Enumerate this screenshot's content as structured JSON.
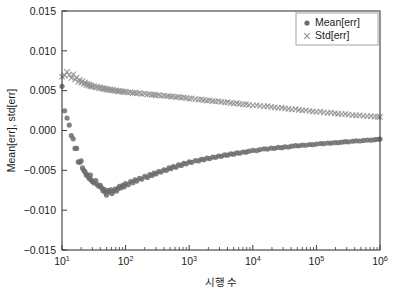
{
  "chart_data": {
    "type": "scatter",
    "title": "",
    "xlabel": "시행 수",
    "ylabel": "Mean[err], std[err]",
    "xscale": "log",
    "yscale": "linear",
    "xlim": [
      10,
      1000000
    ],
    "ylim": [
      -0.015,
      0.015
    ],
    "grid": false,
    "legend_position": "top-right",
    "xticks": [
      {
        "value": 10,
        "label": "10",
        "exponent": "1"
      },
      {
        "value": 100,
        "label": "10",
        "exponent": "2"
      },
      {
        "value": 1000,
        "label": "10",
        "exponent": "3"
      },
      {
        "value": 10000,
        "label": "10",
        "exponent": "4"
      },
      {
        "value": 100000,
        "label": "10",
        "exponent": "5"
      },
      {
        "value": 1000000,
        "label": "10",
        "exponent": "6"
      }
    ],
    "yticks": [
      {
        "value": 0.015,
        "label": "0.015"
      },
      {
        "value": 0.01,
        "label": "0.010"
      },
      {
        "value": 0.005,
        "label": "0.005"
      },
      {
        "value": 0.0,
        "label": "0.000"
      },
      {
        "value": -0.005,
        "label": "−0.005"
      },
      {
        "value": -0.01,
        "label": "−0.010"
      },
      {
        "value": -0.015,
        "label": "−0.015"
      }
    ],
    "series": [
      {
        "name": "Mean[err]",
        "marker": "circle",
        "color": "#6b6b6b",
        "points": [
          [
            10,
            0.00555
          ],
          [
            11,
            0.00248
          ],
          [
            12,
            0.00157
          ],
          [
            13,
            0.00068
          ],
          [
            14,
            -0.00065
          ],
          [
            15,
            -0.00105
          ],
          [
            16,
            -0.00225
          ],
          [
            17,
            -0.00225
          ],
          [
            18,
            -0.00395
          ],
          [
            19,
            -0.004
          ],
          [
            20,
            -0.00382
          ],
          [
            21,
            -0.0047
          ],
          [
            22,
            -0.005
          ],
          [
            23,
            -0.0052
          ],
          [
            24,
            -0.0056
          ],
          [
            25,
            -0.00555
          ],
          [
            26,
            -0.00585
          ],
          [
            27,
            -0.00605
          ],
          [
            28,
            -0.0056
          ],
          [
            29,
            -0.0062
          ],
          [
            30,
            -0.0064
          ],
          [
            32,
            -0.0066
          ],
          [
            34,
            -0.0063
          ],
          [
            36,
            -0.0068
          ],
          [
            38,
            -0.007
          ],
          [
            40,
            -0.0069
          ],
          [
            42,
            -0.0072
          ],
          [
            44,
            -0.00755
          ],
          [
            46,
            -0.0074
          ],
          [
            48,
            -0.00775
          ],
          [
            50,
            -0.0081
          ],
          [
            52,
            -0.00755
          ],
          [
            55,
            -0.0077
          ],
          [
            58,
            -0.00745
          ],
          [
            61,
            -0.0079
          ],
          [
            64,
            -0.0076
          ],
          [
            68,
            -0.00735
          ],
          [
            72,
            -0.0076
          ],
          [
            76,
            -0.0073
          ],
          [
            80,
            -0.007
          ],
          [
            85,
            -0.0072
          ],
          [
            90,
            -0.0069
          ],
          [
            95,
            -0.00705
          ],
          [
            100,
            -0.00665
          ],
          [
            110,
            -0.0068
          ],
          [
            120,
            -0.0064
          ],
          [
            130,
            -0.00655
          ],
          [
            140,
            -0.0062
          ],
          [
            150,
            -0.00635
          ],
          [
            165,
            -0.006
          ],
          [
            180,
            -0.0061
          ],
          [
            200,
            -0.00575
          ],
          [
            220,
            -0.0059
          ],
          [
            240,
            -0.00555
          ],
          [
            260,
            -0.00565
          ],
          [
            280,
            -0.00535
          ],
          [
            300,
            -0.00545
          ],
          [
            330,
            -0.00515
          ],
          [
            360,
            -0.0052
          ],
          [
            400,
            -0.00495
          ],
          [
            440,
            -0.005
          ],
          [
            480,
            -0.0047
          ],
          [
            520,
            -0.00478
          ],
          [
            560,
            -0.00452
          ],
          [
            620,
            -0.0046
          ],
          [
            680,
            -0.00432
          ],
          [
            750,
            -0.00438
          ],
          [
            820,
            -0.00412
          ],
          [
            900,
            -0.00418
          ],
          [
            1000,
            -0.00395
          ],
          [
            1100,
            -0.004
          ],
          [
            1250,
            -0.00378
          ],
          [
            1400,
            -0.00382
          ],
          [
            1550,
            -0.00362
          ],
          [
            1700,
            -0.00366
          ],
          [
            1900,
            -0.00348
          ],
          [
            2100,
            -0.00352
          ],
          [
            2350,
            -0.00334
          ],
          [
            2600,
            -0.00337
          ],
          [
            2900,
            -0.0032
          ],
          [
            3200,
            -0.00323
          ],
          [
            3600,
            -0.00307
          ],
          [
            4000,
            -0.0031
          ],
          [
            4500,
            -0.00294
          ],
          [
            5000,
            -0.00297
          ],
          [
            5600,
            -0.00282
          ],
          [
            6200,
            -0.00285
          ],
          [
            7000,
            -0.0027
          ],
          [
            7800,
            -0.00272
          ],
          [
            8700,
            -0.00259
          ],
          [
            10000,
            -0.0025
          ],
          [
            11500,
            -0.00252
          ],
          [
            13000,
            -0.0024
          ],
          [
            15000,
            -0.0023
          ],
          [
            17000,
            -0.00233
          ],
          [
            19500,
            -0.00222
          ],
          [
            22000,
            -0.00224
          ],
          [
            25000,
            -0.00213
          ],
          [
            28500,
            -0.00215
          ],
          [
            32000,
            -0.00205
          ],
          [
            36500,
            -0.00207
          ],
          [
            41000,
            -0.00197
          ],
          [
            47000,
            -0.0019
          ],
          [
            53000,
            -0.00192
          ],
          [
            60000,
            -0.00183
          ],
          [
            68000,
            -0.00185
          ],
          [
            78000,
            -0.00176
          ],
          [
            88000,
            -0.00178
          ],
          [
            100000,
            -0.0017
          ],
          [
            115000,
            -0.00163
          ],
          [
            130000,
            -0.00165
          ],
          [
            150000,
            -0.00157
          ],
          [
            170000,
            -0.00159
          ],
          [
            195000,
            -0.00151
          ],
          [
            220000,
            -0.00153
          ],
          [
            250000,
            -0.00146
          ],
          [
            285000,
            -0.0014
          ],
          [
            320000,
            -0.00142
          ],
          [
            370000,
            -0.00135
          ],
          [
            420000,
            -0.0013
          ],
          [
            480000,
            -0.00132
          ],
          [
            550000,
            -0.00125
          ],
          [
            630000,
            -0.0012
          ],
          [
            720000,
            -0.00122
          ],
          [
            820000,
            -0.00115
          ],
          [
            920000,
            -0.0011
          ],
          [
            1000000,
            -0.00108
          ]
        ]
      },
      {
        "name": "Std[err]",
        "marker": "x",
        "color": "#949494",
        "points": [
          [
            10,
            0.00675
          ],
          [
            11,
            0.0069
          ],
          [
            12,
            0.00735
          ],
          [
            13,
            0.007
          ],
          [
            14,
            0.0066
          ],
          [
            15,
            0.00705
          ],
          [
            16,
            0.0064
          ],
          [
            17,
            0.00665
          ],
          [
            18,
            0.0061
          ],
          [
            19,
            0.00635
          ],
          [
            20,
            0.006
          ],
          [
            21,
            0.0062
          ],
          [
            22,
            0.00585
          ],
          [
            23,
            0.006
          ],
          [
            24,
            0.00572
          ],
          [
            25,
            0.0059
          ],
          [
            26,
            0.00565
          ],
          [
            27,
            0.00578
          ],
          [
            28,
            0.00555
          ],
          [
            29,
            0.00568
          ],
          [
            30,
            0.00548
          ],
          [
            32,
            0.00558
          ],
          [
            34,
            0.0054
          ],
          [
            36,
            0.00548
          ],
          [
            38,
            0.00532
          ],
          [
            40,
            0.0054
          ],
          [
            42,
            0.00526
          ],
          [
            44,
            0.00533
          ],
          [
            46,
            0.0052
          ],
          [
            48,
            0.00527
          ],
          [
            50,
            0.00514
          ],
          [
            52,
            0.00521
          ],
          [
            55,
            0.00508
          ],
          [
            58,
            0.00515
          ],
          [
            61,
            0.00503
          ],
          [
            64,
            0.00509
          ],
          [
            68,
            0.00498
          ],
          [
            72,
            0.00503
          ],
          [
            76,
            0.00492
          ],
          [
            80,
            0.00497
          ],
          [
            85,
            0.00487
          ],
          [
            90,
            0.00492
          ],
          [
            95,
            0.00482
          ],
          [
            100,
            0.00487
          ],
          [
            110,
            0.00476
          ],
          [
            120,
            0.00481
          ],
          [
            130,
            0.0047
          ],
          [
            140,
            0.00475
          ],
          [
            150,
            0.00465
          ],
          [
            165,
            0.00469
          ],
          [
            180,
            0.00459
          ],
          [
            200,
            0.00463
          ],
          [
            220,
            0.00453
          ],
          [
            240,
            0.00457
          ],
          [
            260,
            0.00447
          ],
          [
            280,
            0.00451
          ],
          [
            300,
            0.00442
          ],
          [
            330,
            0.00445
          ],
          [
            360,
            0.00436
          ],
          [
            400,
            0.00439
          ],
          [
            440,
            0.0043
          ],
          [
            480,
            0.00433
          ],
          [
            520,
            0.00424
          ],
          [
            560,
            0.00427
          ],
          [
            620,
            0.00418
          ],
          [
            680,
            0.00421
          ],
          [
            750,
            0.00412
          ],
          [
            820,
            0.00415
          ],
          [
            900,
            0.00406
          ],
          [
            1000,
            0.004
          ],
          [
            1100,
            0.00403
          ],
          [
            1250,
            0.00394
          ],
          [
            1400,
            0.00388
          ],
          [
            1550,
            0.00391
          ],
          [
            1700,
            0.00382
          ],
          [
            1900,
            0.00376
          ],
          [
            2100,
            0.00379
          ],
          [
            2350,
            0.0037
          ],
          [
            2600,
            0.00364
          ],
          [
            2900,
            0.00367
          ],
          [
            3200,
            0.00358
          ],
          [
            3600,
            0.00352
          ],
          [
            4000,
            0.00355
          ],
          [
            4500,
            0.00346
          ],
          [
            5000,
            0.0034
          ],
          [
            5600,
            0.00343
          ],
          [
            6200,
            0.00334
          ],
          [
            7000,
            0.00328
          ],
          [
            7800,
            0.0033
          ],
          [
            8700,
            0.00322
          ],
          [
            10000,
            0.00315
          ],
          [
            11500,
            0.00317
          ],
          [
            13000,
            0.00309
          ],
          [
            15000,
            0.00303
          ],
          [
            17000,
            0.00305
          ],
          [
            19500,
            0.00296
          ],
          [
            22000,
            0.0029
          ],
          [
            25000,
            0.00284
          ],
          [
            28500,
            0.00286
          ],
          [
            32000,
            0.00277
          ],
          [
            36500,
            0.00271
          ],
          [
            41000,
            0.00265
          ],
          [
            47000,
            0.00267
          ],
          [
            53000,
            0.00258
          ],
          [
            60000,
            0.00252
          ],
          [
            68000,
            0.00254
          ],
          [
            78000,
            0.00245
          ],
          [
            88000,
            0.0024
          ],
          [
            100000,
            0.00234
          ],
          [
            115000,
            0.00236
          ],
          [
            130000,
            0.00228
          ],
          [
            150000,
            0.00222
          ],
          [
            170000,
            0.00224
          ],
          [
            195000,
            0.00216
          ],
          [
            220000,
            0.0021
          ],
          [
            250000,
            0.00205
          ],
          [
            285000,
            0.00207
          ],
          [
            320000,
            0.00199
          ],
          [
            370000,
            0.00194
          ],
          [
            420000,
            0.00189
          ],
          [
            480000,
            0.00191
          ],
          [
            550000,
            0.00184
          ],
          [
            630000,
            0.00179
          ],
          [
            720000,
            0.00181
          ],
          [
            820000,
            0.00175
          ],
          [
            920000,
            0.00171
          ],
          [
            1000000,
            0.0017
          ]
        ]
      }
    ],
    "legend": [
      {
        "label": "Mean[err]",
        "marker": "circle",
        "color": "#6b6b6b"
      },
      {
        "label": "Std[err]",
        "marker": "x",
        "color": "#949494"
      }
    ]
  }
}
